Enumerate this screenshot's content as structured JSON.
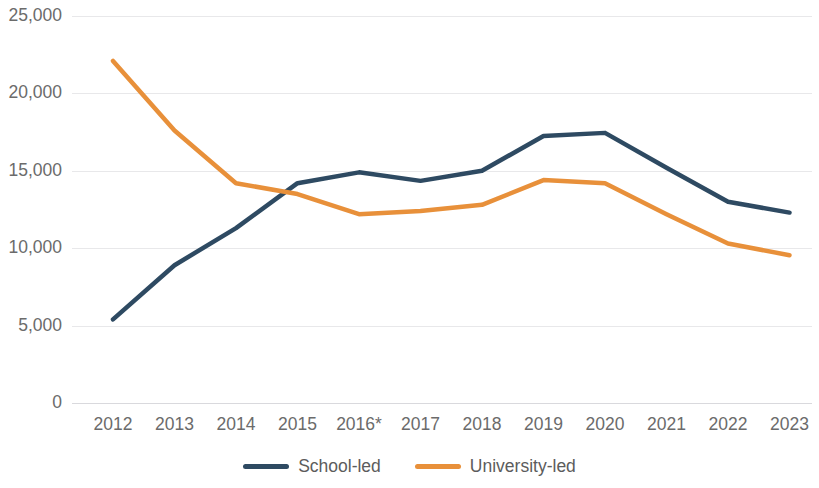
{
  "chart_data": {
    "type": "line",
    "title": "",
    "subtitle": "",
    "xlabel": "",
    "ylabel": "",
    "categories": [
      "2012",
      "2013",
      "2014",
      "2015",
      "2016*",
      "2017",
      "2018",
      "2019",
      "2020",
      "2021",
      "2022",
      "2023"
    ],
    "ylim": [
      0,
      25000
    ],
    "ytick_values": [
      0,
      5000,
      10000,
      15000,
      20000,
      25000
    ],
    "ytick_labels": [
      "0",
      "5,000",
      "10,000",
      "15,000",
      "20,000",
      "25,000"
    ],
    "grid": true,
    "legend_position": "bottom",
    "annotations": [
      "* 2016 figures marked with an asterisk"
    ],
    "series": [
      {
        "name": "School-led",
        "color": "#2e4a62",
        "values": [
          5400,
          8900,
          11300,
          14200,
          14900,
          14350,
          15000,
          17250,
          17450,
          15200,
          13000,
          12300
        ]
      },
      {
        "name": "University-led",
        "color": "#e8903a",
        "values": [
          22100,
          17600,
          14200,
          13500,
          12200,
          12400,
          12800,
          14400,
          14200,
          12200,
          10300,
          9550
        ]
      }
    ]
  }
}
